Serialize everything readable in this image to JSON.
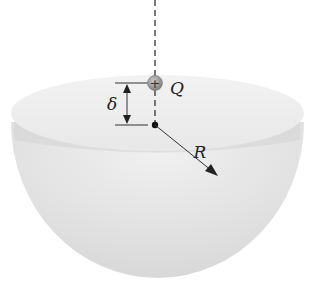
{
  "diagram": {
    "labels": {
      "charge": "Q",
      "offset": "δ",
      "radius": "R"
    },
    "charge_symbol": "+",
    "colors": {
      "bowl_outer": "#dcdcdc",
      "bowl_rim_top": "#efefef",
      "bowl_inner_band": "#d6d6d6",
      "charge_fill": "#9a9a9a",
      "line": "#333333"
    }
  }
}
